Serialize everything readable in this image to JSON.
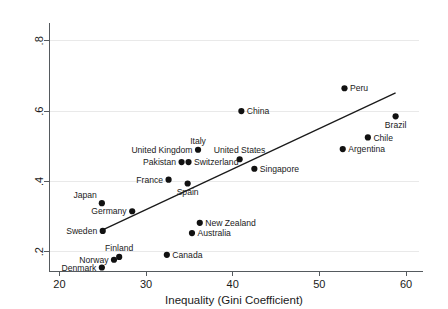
{
  "chart_data": {
    "type": "scatter",
    "title": "",
    "xlabel": "Inequality (Gini Coefficient)",
    "ylabel": "",
    "xlim": [
      18.8,
      61.5
    ],
    "ylim": [
      0.145,
      0.845
    ],
    "xticks": [
      20,
      30,
      40,
      50,
      60
    ],
    "xtick_labels": [
      "20",
      "30",
      "40",
      "50",
      "60"
    ],
    "yticks": [
      0.2,
      0.4,
      0.6,
      0.8
    ],
    "ytick_labels": [
      ".2",
      ".4",
      ".6",
      ".8"
    ],
    "grid": "horizontal",
    "legend": "none",
    "points": [
      {
        "label": "Peru",
        "x": 52.9,
        "y": 0.665,
        "label_pos": "right"
      },
      {
        "label": "China",
        "x": 41.0,
        "y": 0.6,
        "label_pos": "right"
      },
      {
        "label": "Brazil",
        "x": 58.8,
        "y": 0.585,
        "label_pos": "below"
      },
      {
        "label": "Chile",
        "x": 55.6,
        "y": 0.525,
        "label_pos": "right"
      },
      {
        "label": "Argentina",
        "x": 52.7,
        "y": 0.492,
        "label_pos": "right"
      },
      {
        "label": "Italy",
        "x": 36.0,
        "y": 0.49,
        "label_pos": "above"
      },
      {
        "label": "United Kingdom",
        "x": 36.0,
        "y": 0.49,
        "label_pos": "left"
      },
      {
        "label": "United States",
        "x": 40.8,
        "y": 0.463,
        "label_pos": "above"
      },
      {
        "label": "Pakistan",
        "x": 34.1,
        "y": 0.455,
        "label_pos": "left"
      },
      {
        "label": "Switzerland",
        "x": 34.9,
        "y": 0.455,
        "label_pos": "right"
      },
      {
        "label": "Singapore",
        "x": 42.5,
        "y": 0.436,
        "label_pos": "right"
      },
      {
        "label": "France",
        "x": 32.6,
        "y": 0.405,
        "label_pos": "left"
      },
      {
        "label": "Spain",
        "x": 34.8,
        "y": 0.394,
        "label_pos": "below"
      },
      {
        "label": "Japan",
        "x": 24.9,
        "y": 0.338,
        "label_pos": "above-left"
      },
      {
        "label": "Germany",
        "x": 28.4,
        "y": 0.315,
        "label_pos": "left"
      },
      {
        "label": "New Zealand",
        "x": 36.2,
        "y": 0.282,
        "label_pos": "right"
      },
      {
        "label": "Australia",
        "x": 35.3,
        "y": 0.253,
        "label_pos": "right"
      },
      {
        "label": "Sweden",
        "x": 25.0,
        "y": 0.259,
        "label_pos": "left"
      },
      {
        "label": "Canada",
        "x": 32.4,
        "y": 0.191,
        "label_pos": "right"
      },
      {
        "label": "Finland",
        "x": 26.9,
        "y": 0.185,
        "label_pos": "above"
      },
      {
        "label": "Norway",
        "x": 26.3,
        "y": 0.177,
        "label_pos": "left"
      },
      {
        "label": "Denmark",
        "x": 24.9,
        "y": 0.155,
        "label_pos": "left"
      }
    ],
    "fit_line": {
      "x_start": 25.0,
      "y_start": 0.262,
      "x_end": 58.8,
      "y_end": 0.652
    }
  }
}
